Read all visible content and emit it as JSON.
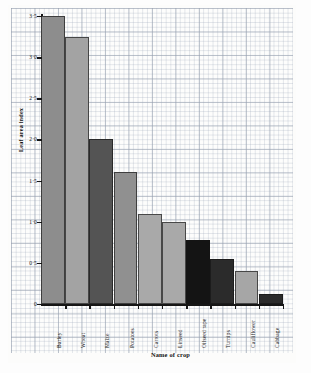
{
  "chart_data": {
    "type": "bar",
    "title": "",
    "xlabel": "Name of crop",
    "ylabel": "Leaf area index",
    "categories": [
      "Barley",
      "Wheat",
      "Maize",
      "Potatoes",
      "Carrots",
      "Linseed",
      "Oilseed rape",
      "Turnips",
      "Cauliflower",
      "Cabbage"
    ],
    "values": [
      3.5,
      3.25,
      2.0,
      1.6,
      1.1,
      1.0,
      0.78,
      0.55,
      0.4,
      0.12
    ],
    "bar_colors": [
      "#8d8d8d",
      "#a3a3a3",
      "#545454",
      "#909090",
      "#a9a9a9",
      "#a9a9a9",
      "#141414",
      "#2b2b2b",
      "#a6a6a6",
      "#2b2b2b"
    ],
    "ylim": [
      0,
      3.5
    ],
    "ytick_values": [
      0,
      0.5,
      1.0,
      1.5,
      2.0,
      2.5,
      3.0,
      3.5
    ],
    "ytick_labels": [
      "0",
      "0·5",
      "1·0",
      "1·5",
      "2·0",
      "2·5",
      "3·0",
      "3·5"
    ],
    "grid": true,
    "grid_style": "graph-paper",
    "legend": "none",
    "background": "#fcfcfb"
  },
  "axes": {
    "y_title": "Leaf area index",
    "x_title": "Name of crop"
  }
}
